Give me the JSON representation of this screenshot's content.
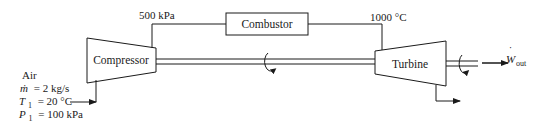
{
  "diagram": {
    "type": "gas-turbine-cycle",
    "components": {
      "compressor": "Compressor",
      "combustor": "Combustor",
      "turbine": "Turbine"
    },
    "states": {
      "compressor_exit_pressure": "500 kPa",
      "turbine_inlet_temperature": "1000 °C"
    },
    "inlet": {
      "fluid": "Air",
      "mass_flow": "ṁ = 2 kg/s",
      "mass_flow_symbol": "ṁ",
      "mass_flow_value": "= 2 kg/s",
      "T1_symbol": "T",
      "T1_sub": "1",
      "T1_value": "= 20 °C",
      "P1_symbol": "P",
      "P1_sub": "1",
      "P1_value": "= 100 kPa"
    },
    "output": {
      "work_symbol": "W",
      "work_dot": "˙",
      "work_sub": "out"
    },
    "colors": {
      "stroke": "#1a1a1a",
      "background": "#ffffff"
    }
  }
}
